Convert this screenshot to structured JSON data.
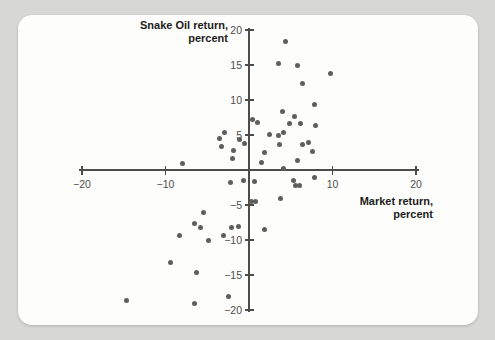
{
  "chart_data": {
    "type": "scatter",
    "title": "",
    "x_axis_title": "Market return,\npercent",
    "y_axis_title": "Snake Oil return,\npercent",
    "x_range": [
      -20,
      20
    ],
    "y_range": [
      -20,
      20
    ],
    "grid": false,
    "x_ticks": [
      {
        "value": -20,
        "label": "−20"
      },
      {
        "value": -10,
        "label": "−10"
      },
      {
        "value": 10,
        "label": "10"
      },
      {
        "value": 20,
        "label": "20"
      }
    ],
    "y_ticks": [
      {
        "value": 20,
        "label": "20"
      },
      {
        "value": 15,
        "label": "15"
      },
      {
        "value": 10,
        "label": "10"
      },
      {
        "value": 5,
        "label": "5"
      },
      {
        "value": -5,
        "label": "−5"
      },
      {
        "value": -10,
        "label": "−10"
      },
      {
        "value": -15,
        "label": "−15"
      },
      {
        "value": -20,
        "label": "−20"
      }
    ],
    "points": [
      [
        4.4,
        18.3
      ],
      [
        3.5,
        15.2
      ],
      [
        5.8,
        14.9
      ],
      [
        9.8,
        13.8
      ],
      [
        6.4,
        12.4
      ],
      [
        7.8,
        9.4
      ],
      [
        4.0,
        8.4
      ],
      [
        5.4,
        7.7
      ],
      [
        0.4,
        7.2
      ],
      [
        1.0,
        6.8
      ],
      [
        4.9,
        6.7
      ],
      [
        6.2,
        6.7
      ],
      [
        8.0,
        6.4
      ],
      [
        2.4,
        5.1
      ],
      [
        3.5,
        5.0
      ],
      [
        4.1,
        5.3
      ],
      [
        3.7,
        3.7
      ],
      [
        6.4,
        3.6
      ],
      [
        7.1,
        3.9
      ],
      [
        7.6,
        2.6
      ],
      [
        1.8,
        2.5
      ],
      [
        1.5,
        1.1
      ],
      [
        5.8,
        1.4
      ],
      [
        4.1,
        0.2
      ],
      [
        -2.9,
        5.4
      ],
      [
        -3.5,
        4.5
      ],
      [
        -1.1,
        4.3
      ],
      [
        -0.5,
        3.8
      ],
      [
        -3.3,
        3.3
      ],
      [
        -1.9,
        2.8
      ],
      [
        -2.0,
        1.6
      ],
      [
        -8.0,
        1.0
      ],
      [
        0.6,
        -1.7
      ],
      [
        5.3,
        -1.5
      ],
      [
        5.6,
        -2.2
      ],
      [
        6.1,
        -2.2
      ],
      [
        7.8,
        -1.1
      ],
      [
        3.8,
        -4.0
      ],
      [
        0.3,
        -4.5
      ],
      [
        0.8,
        -4.5
      ],
      [
        1.9,
        -8.5
      ],
      [
        -2.2,
        -1.8
      ],
      [
        -0.6,
        -1.5
      ],
      [
        -5.4,
        -6.0
      ],
      [
        -6.5,
        -7.6
      ],
      [
        -5.8,
        -8.2
      ],
      [
        -2.1,
        -8.2
      ],
      [
        -1.3,
        -8.1
      ],
      [
        -3.0,
        -9.4
      ],
      [
        -4.8,
        -10.0
      ],
      [
        -8.3,
        -9.4
      ],
      [
        -9.4,
        -13.2
      ],
      [
        -6.3,
        -14.6
      ],
      [
        -14.7,
        -18.6
      ],
      [
        -6.5,
        -19.0
      ],
      [
        -2.5,
        -18.0
      ]
    ],
    "point_color": "#5e5e5e",
    "axis_color": "#4c4c4c",
    "background_color": "#d7d7d3",
    "card_color": "#fdfdfb"
  }
}
